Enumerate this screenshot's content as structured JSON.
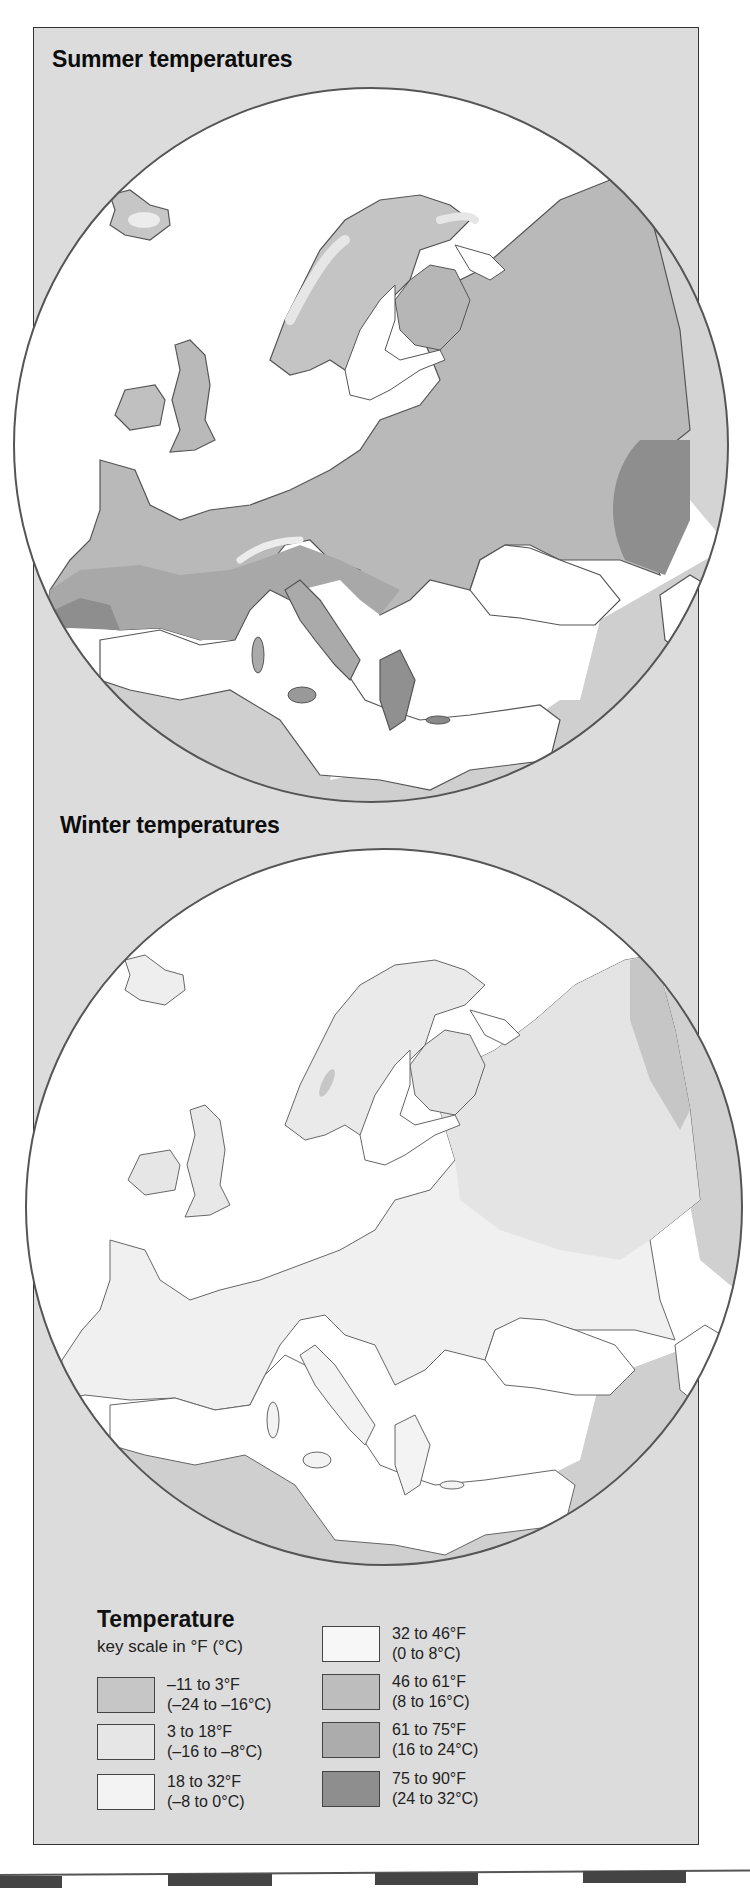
{
  "maps": {
    "summer": {
      "title": "Summer temperatures"
    },
    "winter": {
      "title": "Winter temperatures"
    }
  },
  "legend": {
    "title": "Temperature",
    "subtitle": "key scale in °F (°C)",
    "items": [
      {
        "f": "–11 to 3°F",
        "c": "(–24 to –16°C)",
        "color": "#c6c6c6"
      },
      {
        "f": "3 to 18°F",
        "c": "(–16 to –8°C)",
        "color": "#e6e6e6"
      },
      {
        "f": "18 to 32°F",
        "c": "(–8 to 0°C)",
        "color": "#f3f3f3"
      },
      {
        "f": "32 to 46°F",
        "c": "(0 to 8°C)",
        "color": "#f7f7f7"
      },
      {
        "f": "46 to 61°F",
        "c": "(8 to 16°C)",
        "color": "#bdbdbd"
      },
      {
        "f": "61 to 75°F",
        "c": "(16 to 24°C)",
        "color": "#acacac"
      },
      {
        "f": "75 to 90°F",
        "c": "(24 to 32°C)",
        "color": "#8e8e8e"
      }
    ]
  },
  "colors": {
    "panel_bg": "#dcdcdc",
    "sea": "#ffffff",
    "outside_region": "#cfcfcf",
    "coast": "#555555"
  }
}
